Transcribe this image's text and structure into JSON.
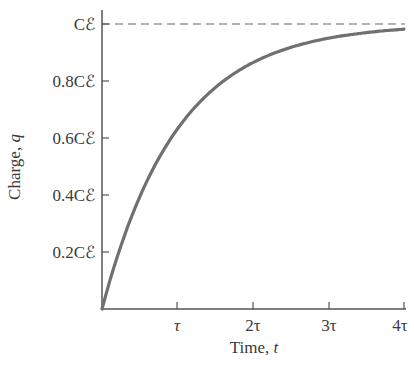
{
  "chart_data": {
    "type": "line",
    "title": "",
    "xlabel": "Time, t",
    "ylabel": "Charge, q",
    "x_ticks": [
      {
        "value": 1,
        "label": "τ"
      },
      {
        "value": 2,
        "label": "2τ"
      },
      {
        "value": 3,
        "label": "3τ"
      },
      {
        "value": 4,
        "label": "4τ"
      }
    ],
    "y_ticks": [
      {
        "value": 0.2,
        "label": "0.2Cℰ"
      },
      {
        "value": 0.4,
        "label": "0.4Cℰ"
      },
      {
        "value": 0.6,
        "label": "0.6Cℰ"
      },
      {
        "value": 0.8,
        "label": "0.8Cℰ"
      },
      {
        "value": 1.0,
        "label": "Cℰ"
      }
    ],
    "xlim": [
      0,
      4
    ],
    "ylim": [
      0,
      1.0
    ],
    "grid": false,
    "legend": null,
    "series": [
      {
        "name": "q(t) = Cℰ(1 − e^(−t/τ))",
        "x": [
          0,
          0.25,
          0.5,
          0.75,
          1.0,
          1.25,
          1.5,
          1.75,
          2.0,
          2.25,
          2.5,
          2.75,
          3.0,
          3.25,
          3.5,
          3.75,
          4.0
        ],
        "values": [
          0,
          0.221,
          0.393,
          0.528,
          0.632,
          0.713,
          0.777,
          0.826,
          0.865,
          0.895,
          0.918,
          0.936,
          0.95,
          0.961,
          0.97,
          0.976,
          0.982
        ],
        "color": "#707070"
      }
    ],
    "annotations": [
      {
        "type": "asymptote",
        "y": 1.0,
        "style": "dashed",
        "label": "Cℰ"
      }
    ]
  },
  "labels": {
    "xlabel_text": "Time, ",
    "xlabel_var": "t",
    "ylabel_text": "Charge, ",
    "ylabel_var": "q",
    "x_tick_1": "τ",
    "x_tick_2": "2τ",
    "x_tick_3": "3τ",
    "x_tick_4": "4τ",
    "y_tick_02": "0.2Cℰ",
    "y_tick_04": "0.4Cℰ",
    "y_tick_06": "0.6Cℰ",
    "y_tick_08": "0.8Cℰ",
    "y_tick_10": "Cℰ"
  },
  "colors": {
    "axis": "#555555",
    "curve": "#707070",
    "dashed": "#666666",
    "text": "#3a3a3a"
  }
}
